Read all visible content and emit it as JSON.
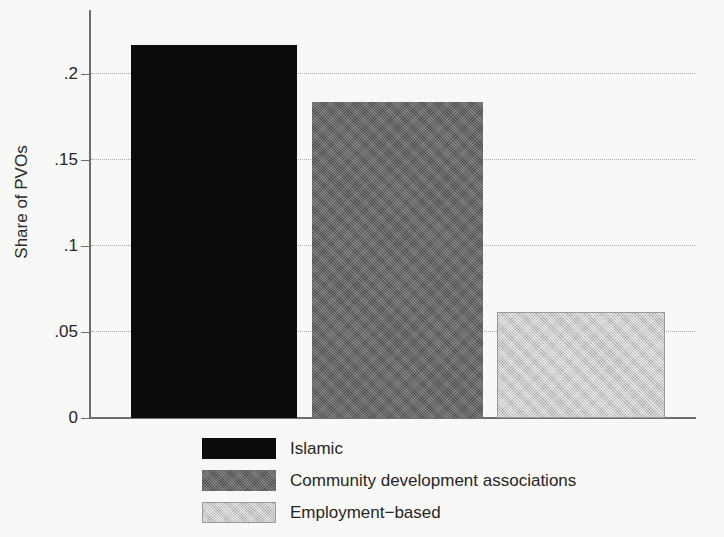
{
  "chart_data": {
    "type": "bar",
    "title": "",
    "xlabel": "",
    "ylabel": "Share of PVOs",
    "categories": [
      "Islamic",
      "Community development associations",
      "Employment−based"
    ],
    "values": [
      0.217,
      0.184,
      0.062
    ],
    "ylim": [
      0,
      0.2375
    ],
    "yticks": [
      0,
      0.05,
      0.1,
      0.15,
      0.2
    ],
    "ytick_labels": [
      "0",
      ".05",
      ".1",
      ".15",
      ".2"
    ],
    "grid": "horizontal-dotted",
    "legend_position": "below-axes",
    "series": [
      {
        "name": "Islamic",
        "value": 0.217,
        "fill": "solid-black",
        "color": "#0b0b0b"
      },
      {
        "name": "Community development associations",
        "value": 0.184,
        "fill": "dither-dark",
        "color": "#4f4f4f"
      },
      {
        "name": "Employment−based",
        "value": 0.062,
        "fill": "dither-light",
        "color": "#c9c9c9"
      }
    ]
  },
  "axes": {
    "y_title": "Share of PVOs",
    "ticks": [
      {
        "label": ".2",
        "value": 0.2
      },
      {
        "label": ".15",
        "value": 0.15
      },
      {
        "label": ".1",
        "value": 0.1
      },
      {
        "label": ".05",
        "value": 0.05
      },
      {
        "label": "0",
        "value": 0
      }
    ]
  },
  "legend": {
    "items": [
      {
        "label": "Islamic"
      },
      {
        "label": "Community development associations"
      },
      {
        "label": "Employment−based"
      }
    ]
  },
  "colors": {
    "background": "#f8f8f6",
    "axis": "#6e6e6e",
    "grid": "#a9a9a9",
    "text": "#262626",
    "bar_islamic": "#0b0b0b",
    "bar_community": "#4f4f4f",
    "bar_employment": "#c9c9c9"
  }
}
